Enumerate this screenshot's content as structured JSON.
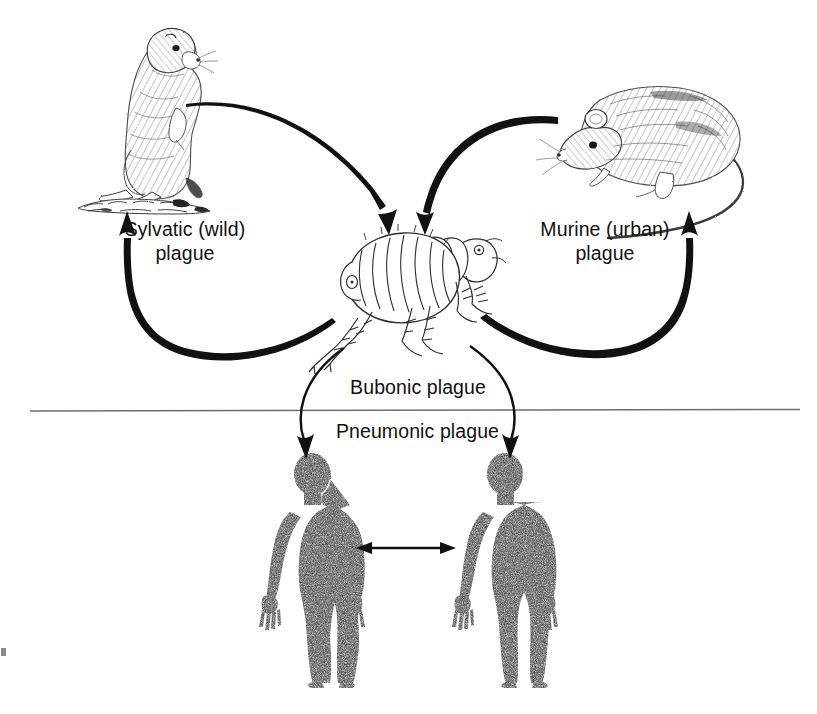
{
  "figure": {
    "background_color": "#ffffff",
    "ink_color": "#111111",
    "divider_color": "#6d6d6d"
  },
  "labels": {
    "sylvatic": "Sylvatic (wild)\nplague",
    "murine": "Murine (urban)\nplague",
    "bubonic": "Bubonic plague",
    "pneumonic": "Pneumonic plague"
  },
  "nodes": [
    {
      "id": "prairie-dog",
      "name": "prairie-dog-illustration",
      "description": "Prairie dog standing upright on a burrow mound, facing right",
      "style": "pen-and-ink stipple drawing",
      "x": 88,
      "y": 22,
      "width": 125,
      "height": 190
    },
    {
      "id": "rat",
      "name": "rat-illustration",
      "description": "Rat in profile facing left with long curving tail",
      "style": "pen-and-ink stipple drawing",
      "x": 548,
      "y": 78,
      "width": 215,
      "height": 130
    },
    {
      "id": "flea",
      "name": "flea-illustration",
      "description": "Flea in profile with segmented abdomen, head at right, bristled legs",
      "style": "line drawing",
      "x": 338,
      "y": 225,
      "width": 170,
      "height": 135
    },
    {
      "id": "human-left",
      "name": "human-silhouette-left",
      "description": "Black human silhouette, front view, arms at sides",
      "x": 262,
      "y": 455,
      "width": 100,
      "height": 228
    },
    {
      "id": "human-right",
      "name": "human-silhouette-right",
      "description": "Black human silhouette, front view, arms at sides",
      "x": 455,
      "y": 455,
      "width": 100,
      "height": 228
    }
  ],
  "arrows": [
    {
      "id": "prairie-dog-to-flea",
      "name": "arrow-prairie-dog-to-flea",
      "from": "prairie-dog",
      "to": "flea",
      "direction": "down-right",
      "style": "tapered arc"
    },
    {
      "id": "flea-to-prairie-dog",
      "name": "arrow-flea-to-prairie-dog",
      "from": "flea",
      "to": "prairie-dog",
      "direction": "left-up",
      "style": "tapered arc"
    },
    {
      "id": "rat-to-flea",
      "name": "arrow-rat-to-flea",
      "from": "rat",
      "to": "flea",
      "direction": "down-left",
      "style": "tapered arc"
    },
    {
      "id": "flea-to-rat",
      "name": "arrow-flea-to-rat",
      "from": "flea",
      "to": "rat",
      "direction": "right-up",
      "style": "tapered arc"
    },
    {
      "id": "flea-to-human-left",
      "name": "arrow-flea-to-human-left",
      "from": "flea",
      "to": "human-left",
      "direction": "down-left",
      "style": "arc"
    },
    {
      "id": "flea-to-human-right",
      "name": "arrow-flea-to-human-right",
      "from": "flea",
      "to": "human-right",
      "direction": "down-right",
      "style": "arc"
    },
    {
      "id": "human-to-human",
      "name": "arrow-human-to-human",
      "from": "human-left",
      "to": "human-right",
      "direction": "bidirectional",
      "style": "straight double-headed"
    }
  ],
  "divider": {
    "name": "horizontal-divider",
    "x1": 30,
    "x2": 800,
    "y": 410
  }
}
